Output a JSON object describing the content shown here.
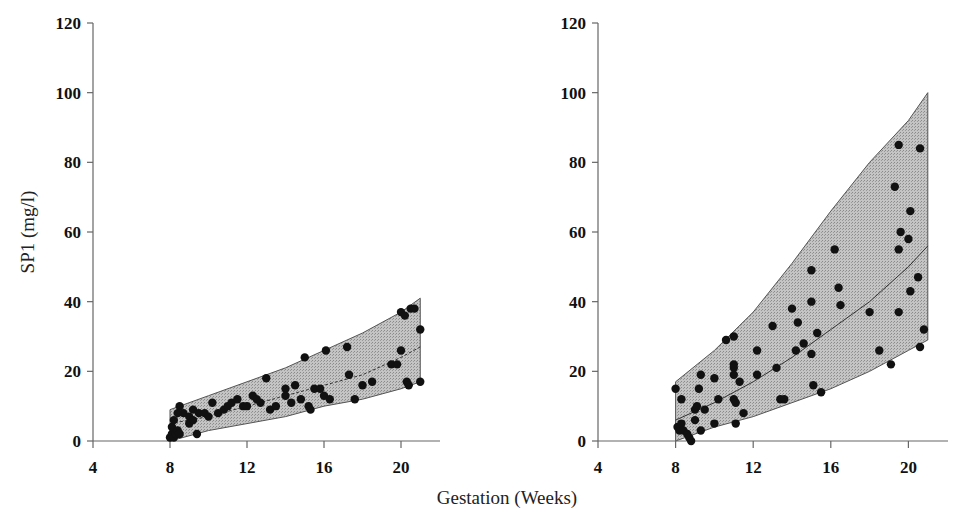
{
  "chart_data": [
    {
      "type": "scatter",
      "panel": "left",
      "title": "",
      "xlabel": "Gestation (Weeks)",
      "ylabel": "SP1 (mg/l)",
      "xlim": [
        4,
        22
      ],
      "ylim": [
        0,
        120
      ],
      "x_ticks": [
        4,
        8,
        12,
        16,
        20
      ],
      "y_ticks": [
        0,
        20,
        40,
        60,
        80,
        100,
        120
      ],
      "grid": false,
      "band": {
        "x": [
          8,
          10,
          12,
          14,
          16,
          18,
          20,
          21
        ],
        "upper": [
          9,
          13,
          17,
          21,
          26,
          31,
          37,
          41
        ],
        "median": [
          5,
          7,
          10,
          13,
          16,
          19,
          24,
          27
        ],
        "lower": [
          0,
          3,
          5,
          7,
          10,
          12,
          15,
          17
        ]
      },
      "points": [
        [
          8.0,
          1
        ],
        [
          8.1,
          2
        ],
        [
          8.1,
          4
        ],
        [
          8.2,
          1
        ],
        [
          8.3,
          2
        ],
        [
          8.4,
          3
        ],
        [
          8.5,
          2
        ],
        [
          8.2,
          6
        ],
        [
          8.4,
          8
        ],
        [
          8.5,
          10
        ],
        [
          8.7,
          8
        ],
        [
          9.0,
          7
        ],
        [
          9.0,
          5
        ],
        [
          9.2,
          9
        ],
        [
          9.2,
          6
        ],
        [
          9.4,
          2
        ],
        [
          9.5,
          8
        ],
        [
          9.8,
          8
        ],
        [
          10.0,
          7
        ],
        [
          10.2,
          11
        ],
        [
          10.5,
          8
        ],
        [
          10.8,
          9
        ],
        [
          11.0,
          10
        ],
        [
          11.2,
          11
        ],
        [
          11.5,
          12
        ],
        [
          11.8,
          10
        ],
        [
          12.0,
          10
        ],
        [
          12.3,
          13
        ],
        [
          12.5,
          12
        ],
        [
          12.7,
          11
        ],
        [
          13.0,
          18
        ],
        [
          13.2,
          9
        ],
        [
          13.5,
          10
        ],
        [
          14.0,
          15
        ],
        [
          14.0,
          13
        ],
        [
          14.3,
          11
        ],
        [
          14.5,
          16
        ],
        [
          14.8,
          12
        ],
        [
          15.0,
          24
        ],
        [
          15.2,
          10
        ],
        [
          15.3,
          9
        ],
        [
          15.5,
          15
        ],
        [
          15.8,
          15
        ],
        [
          16.0,
          13
        ],
        [
          16.1,
          26
        ],
        [
          16.3,
          12
        ],
        [
          17.2,
          27
        ],
        [
          17.3,
          19
        ],
        [
          17.6,
          12
        ],
        [
          18.0,
          16
        ],
        [
          18.5,
          17
        ],
        [
          19.5,
          22
        ],
        [
          19.8,
          22
        ],
        [
          20.0,
          26
        ],
        [
          20.0,
          37
        ],
        [
          20.2,
          36
        ],
        [
          20.3,
          17
        ],
        [
          20.4,
          16
        ],
        [
          20.5,
          38
        ],
        [
          20.7,
          38
        ],
        [
          21.0,
          17
        ],
        [
          21.0,
          32
        ]
      ]
    },
    {
      "type": "scatter",
      "panel": "right",
      "title": "",
      "xlabel": "Gestation (Weeks)",
      "ylabel": "SP1 (mg/l)",
      "xlim": [
        4,
        22
      ],
      "ylim": [
        0,
        120
      ],
      "x_ticks": [
        4,
        8,
        12,
        16,
        20
      ],
      "y_ticks": [
        0,
        20,
        40,
        60,
        80,
        100,
        120
      ],
      "grid": false,
      "band": {
        "x": [
          8,
          10,
          12,
          14,
          16,
          18,
          20,
          21
        ],
        "upper": [
          17,
          26,
          37,
          51,
          66,
          80,
          92,
          100
        ],
        "median": [
          6,
          11,
          17,
          24,
          32,
          40,
          50,
          56
        ],
        "lower": [
          0,
          4,
          7,
          11,
          15,
          20,
          26,
          29
        ]
      },
      "points": [
        [
          8.0,
          15
        ],
        [
          8.1,
          4
        ],
        [
          8.2,
          3
        ],
        [
          8.3,
          12
        ],
        [
          8.3,
          5
        ],
        [
          8.4,
          3
        ],
        [
          8.6,
          2
        ],
        [
          8.7,
          1
        ],
        [
          8.8,
          0
        ],
        [
          9.0,
          9
        ],
        [
          9.0,
          6
        ],
        [
          9.1,
          10
        ],
        [
          9.2,
          15
        ],
        [
          9.3,
          19
        ],
        [
          9.3,
          3
        ],
        [
          9.5,
          9
        ],
        [
          10.0,
          18
        ],
        [
          10.0,
          5
        ],
        [
          10.2,
          12
        ],
        [
          10.6,
          29
        ],
        [
          11.0,
          30
        ],
        [
          11.0,
          22
        ],
        [
          11.0,
          21
        ],
        [
          11.0,
          19
        ],
        [
          11.0,
          12
        ],
        [
          11.1,
          11
        ],
        [
          11.1,
          5
        ],
        [
          11.3,
          17
        ],
        [
          11.5,
          8
        ],
        [
          12.2,
          26
        ],
        [
          12.2,
          19
        ],
        [
          13.0,
          33
        ],
        [
          13.2,
          21
        ],
        [
          13.4,
          12
        ],
        [
          13.6,
          12
        ],
        [
          14.0,
          38
        ],
        [
          14.2,
          26
        ],
        [
          14.3,
          34
        ],
        [
          14.6,
          28
        ],
        [
          15.0,
          49
        ],
        [
          15.0,
          40
        ],
        [
          15.0,
          25
        ],
        [
          15.1,
          16
        ],
        [
          15.3,
          31
        ],
        [
          15.5,
          14
        ],
        [
          16.2,
          55
        ],
        [
          16.4,
          44
        ],
        [
          16.5,
          39
        ],
        [
          18.0,
          37
        ],
        [
          18.5,
          26
        ],
        [
          19.1,
          22
        ],
        [
          19.3,
          73
        ],
        [
          19.5,
          85
        ],
        [
          19.5,
          55
        ],
        [
          19.5,
          37
        ],
        [
          19.6,
          60
        ],
        [
          20.0,
          58
        ],
        [
          20.1,
          66
        ],
        [
          20.1,
          43
        ],
        [
          20.5,
          47
        ],
        [
          20.6,
          84
        ],
        [
          20.6,
          27
        ],
        [
          20.8,
          32
        ]
      ]
    }
  ],
  "labels": {
    "ylabel": "SP1 (mg/l)",
    "xlabel": "Gestation (Weeks)",
    "x_ticks": [
      "4",
      "8",
      "12",
      "16",
      "20"
    ],
    "y_ticks": [
      "0",
      "20",
      "40",
      "60",
      "80",
      "100",
      "120"
    ]
  },
  "colors": {
    "band_fill": "#bdbdbd",
    "band_edge": "#555555",
    "points": "#111111",
    "axis": "#666666"
  }
}
